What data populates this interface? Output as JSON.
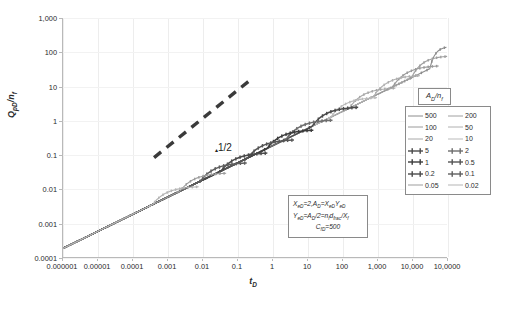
{
  "chart_data": {
    "type": "line",
    "title": "",
    "xlabel": "tD",
    "ylabel": "QpD/nf",
    "xscale": "log",
    "yscale": "log",
    "xlim": [
      1e-06,
      100000
    ],
    "ylim": [
      0.0001,
      1000
    ],
    "grid": true,
    "legend_position": "right",
    "xticks": [
      "0.000001",
      "0.00001",
      "0.0001",
      "0.001",
      "0.01",
      "0.1",
      "1",
      "10",
      "100",
      "1,000",
      "10,000",
      "10,0000"
    ],
    "yticks": [
      "1,000",
      "100",
      "10",
      "1",
      "0.1",
      "0.01",
      "0.001",
      "0.0001"
    ],
    "legend_title": "AD/nf",
    "series": [
      {
        "name": "500",
        "color": "#8c8c8c",
        "marker": false,
        "branch_x": 30000.0,
        "plateau_y": 150.0
      },
      {
        "name": "200",
        "color": "#a0a0a0",
        "marker": false,
        "branch_x": 9000.0,
        "plateau_y": 80.0
      },
      {
        "name": "100",
        "color": "#9a9a9a",
        "marker": false,
        "branch_x": 2600.0,
        "plateau_y": 42.0
      },
      {
        "name": "50",
        "color": "#b0b0b0",
        "marker": false,
        "branch_x": 750.0,
        "plateau_y": 22.0
      },
      {
        "name": "20",
        "color": "#a8a8a8",
        "marker": false,
        "branch_x": 150.0,
        "plateau_y": 9.5
      },
      {
        "name": "10",
        "color": "#bbbbbb",
        "marker": false,
        "branch_x": 45.0,
        "plateau_y": 5.0
      },
      {
        "name": "5",
        "color": "#4a4a4a",
        "marker": true,
        "branch_x": 13.0,
        "plateau_y": 2.6
      },
      {
        "name": "2",
        "color": "#6e6e6e",
        "marker": true,
        "branch_x": 2.4,
        "plateau_y": 1.1
      },
      {
        "name": "1",
        "color": "#3c3c3c",
        "marker": true,
        "branch_x": 0.68,
        "plateau_y": 0.56
      },
      {
        "name": "0.5",
        "color": "#555555",
        "marker": true,
        "branch_x": 0.19,
        "plateau_y": 0.29
      },
      {
        "name": "0.2",
        "color": "#4a4a4a",
        "marker": true,
        "branch_x": 0.033,
        "plateau_y": 0.12
      },
      {
        "name": "0.1",
        "color": "#5f5f5f",
        "marker": true,
        "branch_x": 0.0085,
        "plateau_y": 0.062
      },
      {
        "name": "0.05",
        "color": "#9d9d9d",
        "marker": false,
        "branch_x": 0.0022,
        "plateau_y": 0.031
      },
      {
        "name": "0.02",
        "color": "#b5b5b5",
        "marker": false,
        "branch_x": 0.00036,
        "plateau_y": 0.0125
      }
    ],
    "reference_line": {
      "label": "1/2",
      "slope": 0.5,
      "style": "dashed",
      "color": "#3a3a3a",
      "x_start": 0.0004,
      "y_start": 0.085,
      "x_end": 0.25,
      "y_end": 17.0
    },
    "annotations": [
      "XeD=2,AD=XeDYeD",
      "YeD=AD/2=nfdfrac/Xf",
      "CfD=500"
    ]
  },
  "axes": {
    "y_title_main": "Q",
    "y_title_sub1": "pD",
    "y_title_mid": "/n",
    "y_title_sub2": "f",
    "x_title_main": "t",
    "x_title_sub": "D"
  },
  "legend": {
    "title_main": "A",
    "title_sub1": "D",
    "title_mid": "/n",
    "title_sub2": "f"
  },
  "equation": {
    "line1_a": "X",
    "line1_sub_a": "eD",
    "line1_b": "=2,A",
    "line1_sub_b": "D",
    "line1_c": "=X",
    "line1_sub_c": "eD",
    "line1_d": "Y",
    "line1_sub_d": "eD",
    "line2_a": "Y",
    "line2_sub_a": "eD",
    "line2_b": "=A",
    "line2_sub_b": "D",
    "line2_c": "/2=n",
    "line2_sub_c": "f",
    "line2_d": "d",
    "line2_sub_d": "frac",
    "line2_e": "/X",
    "line2_sub_e": "f",
    "line3_a": "C",
    "line3_sub_a": "fD",
    "line3_b": "=500"
  },
  "slope_annotation": {
    "exponent": "1/2"
  }
}
